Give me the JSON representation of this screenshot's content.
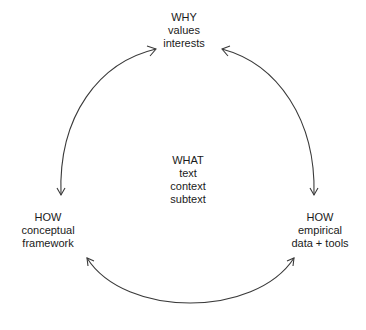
{
  "diagram": {
    "type": "cycle",
    "stroke_color": "#3a3a3a",
    "text_color": "#1a1a1a",
    "nodes": {
      "why": {
        "title": "WHY",
        "lines": [
          "values",
          "interests"
        ]
      },
      "what": {
        "title": "WHAT",
        "lines": [
          "text",
          "context",
          "subtext"
        ]
      },
      "how_left": {
        "title": "HOW",
        "lines": [
          "conceptual",
          "framework"
        ]
      },
      "how_right": {
        "title": "HOW",
        "lines": [
          "empirical",
          "data + tools"
        ]
      }
    },
    "edges": [
      {
        "from": "why",
        "to": "how_left",
        "direction": "bidirectional",
        "shape": "arc"
      },
      {
        "from": "why",
        "to": "how_right",
        "direction": "bidirectional",
        "shape": "arc"
      },
      {
        "from": "how_left",
        "to": "how_right",
        "direction": "bidirectional",
        "shape": "arc"
      }
    ]
  }
}
